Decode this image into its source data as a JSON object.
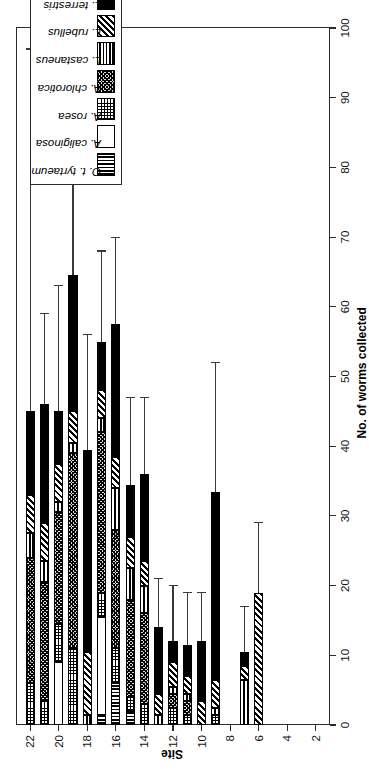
{
  "chart_data": {
    "type": "bar",
    "orientation": "horizontal-stacked",
    "title": "",
    "xlabel": "No. of worms collected",
    "ylabel": "Site",
    "xlim": [
      0,
      100
    ],
    "ylim": [
      1,
      23
    ],
    "xticks": [
      0,
      10,
      20,
      30,
      40,
      50,
      60,
      70,
      80,
      90,
      100
    ],
    "yticks": [
      2,
      4,
      6,
      8,
      10,
      12,
      14,
      16,
      18,
      20,
      22
    ],
    "grid": false,
    "legend_position": "upper-right",
    "categories": [
      2,
      3,
      4,
      5,
      6,
      7,
      8,
      9,
      10,
      11,
      12,
      13,
      14,
      15,
      16,
      17,
      18,
      19,
      20,
      21,
      22
    ],
    "series": [
      {
        "name": "O. t. tyrtaeum",
        "pattern": "vertical-stripes",
        "values": [
          0,
          0,
          0,
          0,
          0,
          0,
          0,
          0,
          0,
          0,
          0,
          0,
          0,
          2.0,
          6.0,
          1.5,
          0,
          0,
          0,
          0,
          0
        ]
      },
      {
        "name": "A. caliginosa",
        "pattern": "open-white",
        "values": [
          0,
          0,
          0,
          0,
          0,
          0,
          0,
          0,
          0,
          0,
          0,
          0,
          0,
          0,
          0,
          14.0,
          0,
          0,
          9.0,
          0,
          0
        ]
      },
      {
        "name": "A. rosea",
        "pattern": "fine-grid",
        "values": [
          0,
          0,
          0,
          0,
          0,
          0,
          0,
          1.5,
          0,
          1.5,
          2.5,
          0,
          3.0,
          2.0,
          5.0,
          3.5,
          0,
          11.0,
          5.5,
          3.5,
          6.0
        ]
      },
      {
        "name": "A. chlorotica",
        "pattern": "checkered",
        "values": [
          0,
          0,
          0,
          0,
          0,
          0,
          0,
          0,
          0,
          2.0,
          2.0,
          0,
          13.0,
          14.0,
          17.0,
          23.0,
          0,
          28.0,
          16.0,
          17.0,
          18.0
        ]
      },
      {
        "name": "L. castaneus",
        "pattern": "horizontal-stripes",
        "values": [
          0,
          0,
          0,
          0,
          0,
          6.5,
          0,
          1.0,
          0,
          1.0,
          1.0,
          1.5,
          4.0,
          4.5,
          6.0,
          2.0,
          1.5,
          1.5,
          1.5,
          3.0,
          3.5
        ]
      },
      {
        "name": "L. rubellus",
        "pattern": "diagonal-stripes",
        "values": [
          0,
          0,
          0,
          0,
          19.0,
          2.0,
          0,
          4.0,
          3.5,
          2.5,
          3.5,
          3.0,
          3.5,
          4.5,
          4.5,
          4.0,
          9.0,
          4.5,
          5.5,
          5.5,
          5.5
        ]
      },
      {
        "name": "L. terrestris",
        "pattern": "solid-black",
        "values": [
          0,
          0,
          0,
          0,
          0,
          2.0,
          0,
          27.0,
          8.5,
          4.5,
          3.0,
          9.5,
          12.5,
          7.5,
          19.0,
          7.0,
          29.0,
          19.5,
          7.5,
          17.0,
          12.0
        ]
      }
    ],
    "totals": [
      0,
      0,
      0,
      0,
      19,
      10.5,
      0,
      33.5,
      12,
      11.5,
      12,
      14,
      36,
      34.5,
      57.5,
      55,
      39.5,
      64.5,
      45,
      46,
      45
    ],
    "error_high": [
      0,
      0,
      0,
      0,
      29,
      17,
      0,
      52,
      19,
      19,
      20,
      21,
      47,
      47,
      70,
      68,
      56,
      97,
      63,
      59,
      97
    ],
    "bar_labels": [
      {
        "site": 22,
        "total": 45,
        "upper": 97
      },
      {
        "site": 21,
        "total": 46,
        "upper": 59
      },
      {
        "site": 20,
        "total": 45,
        "upper": 63
      },
      {
        "site": 19,
        "total": 64.5,
        "upper": 97
      },
      {
        "site": 18,
        "total": 39.5,
        "upper": 56
      },
      {
        "site": 17,
        "total": 55,
        "upper": 68
      },
      {
        "site": 16,
        "total": 57.5,
        "upper": 70
      },
      {
        "site": 15,
        "total": 34.5,
        "upper": 47
      },
      {
        "site": 14,
        "total": 36,
        "upper": 47
      },
      {
        "site": 13,
        "total": 14,
        "upper": 21
      },
      {
        "site": 12,
        "total": 12,
        "upper": 20
      },
      {
        "site": 11,
        "total": 11.5,
        "upper": 19
      },
      {
        "site": 10,
        "total": 12,
        "upper": 19
      },
      {
        "site": 9,
        "total": 33.5,
        "upper": 52
      },
      {
        "site": 8,
        "total": 0,
        "upper": 0
      },
      {
        "site": 7,
        "total": 10.5,
        "upper": 17
      },
      {
        "site": 6,
        "total": 19,
        "upper": 29
      },
      {
        "site": 5,
        "total": 0,
        "upper": 0
      },
      {
        "site": 4,
        "total": 0,
        "upper": 0
      },
      {
        "site": 3,
        "total": 0,
        "upper": 0
      },
      {
        "site": 2,
        "total": 0,
        "upper": 0
      }
    ]
  },
  "axes": {
    "x_title": "No. of worms collected",
    "y_title": "Site",
    "x_tick_labels": [
      "0",
      "10",
      "20",
      "30",
      "40",
      "50",
      "60",
      "70",
      "80",
      "90",
      "100"
    ],
    "y_tick_labels": [
      "2",
      "4",
      "6",
      "8",
      "10",
      "12",
      "14",
      "16",
      "18",
      "20",
      "22"
    ]
  },
  "legend": {
    "entries": [
      {
        "label": "O. t. tyrtaeum",
        "pattern": "vertical-stripes"
      },
      {
        "label": "A. caliginosa",
        "pattern": "open-white"
      },
      {
        "label": "A. rosea",
        "pattern": "fine-grid"
      },
      {
        "label": "A. chlorotica",
        "pattern": "checkered"
      },
      {
        "label": "L. castaneus",
        "pattern": "horizontal-stripes"
      },
      {
        "label": "L. rubellus",
        "pattern": "diagonal-stripes"
      },
      {
        "label": "L. terrestris",
        "pattern": "solid-black"
      }
    ]
  },
  "colors": {
    "ink": "#000000",
    "axis": "#2b2b2b",
    "error_bar": "#3a3a3a",
    "background": "#ffffff"
  }
}
